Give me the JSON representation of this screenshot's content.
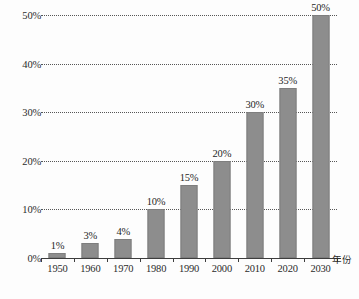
{
  "chart_data": {
    "type": "bar",
    "title": "",
    "subtitle": "",
    "xlabel": "年份",
    "ylabel": "",
    "categories": [
      "1950",
      "1960",
      "1970",
      "1980",
      "1990",
      "2000",
      "2010",
      "2020",
      "2030"
    ],
    "values": [
      1,
      3,
      4,
      10,
      15,
      20,
      30,
      35,
      50
    ],
    "value_labels": [
      "1%",
      "3%",
      "4%",
      "10%",
      "15%",
      "20%",
      "30%",
      "35%",
      "50%"
    ],
    "ylim": [
      0,
      50
    ],
    "ytick_values": [
      0,
      10,
      20,
      30,
      40,
      50
    ],
    "ytick_labels": [
      "0%",
      "10%",
      "20%",
      "30%",
      "40%",
      "50%"
    ],
    "grid": "horizontal-dotted",
    "legend": "none",
    "series": [
      {
        "name": "",
        "values": [
          1,
          3,
          4,
          10,
          15,
          20,
          30,
          35,
          50
        ],
        "color": "#8d8d8d"
      }
    ],
    "colors": {
      "bar": "#8d8d8d",
      "bar_border": "#7e7e7e",
      "gridline": "#3a3a3a",
      "axis": "#3d3d3d",
      "text": "#2b2b2b",
      "background": "#fdfdfd"
    }
  }
}
